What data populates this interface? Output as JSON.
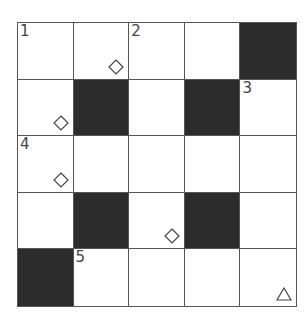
{
  "puzzle": {
    "rows": 5,
    "cols": 5,
    "colors": {
      "block": "#2c2c2c",
      "line": "#555555",
      "cell": "#ffffff"
    },
    "cells": [
      [
        {
          "type": "white",
          "number": "1"
        },
        {
          "type": "white",
          "mark": "diamond"
        },
        {
          "type": "white",
          "number": "2"
        },
        {
          "type": "white"
        },
        {
          "type": "black"
        }
      ],
      [
        {
          "type": "white",
          "mark": "diamond"
        },
        {
          "type": "black"
        },
        {
          "type": "white"
        },
        {
          "type": "black"
        },
        {
          "type": "white",
          "number": "3"
        }
      ],
      [
        {
          "type": "white",
          "number": "4",
          "mark": "diamond"
        },
        {
          "type": "white"
        },
        {
          "type": "white"
        },
        {
          "type": "white"
        },
        {
          "type": "white"
        }
      ],
      [
        {
          "type": "white"
        },
        {
          "type": "black"
        },
        {
          "type": "white",
          "mark": "diamond"
        },
        {
          "type": "black"
        },
        {
          "type": "white"
        }
      ],
      [
        {
          "type": "black"
        },
        {
          "type": "white",
          "number": "5"
        },
        {
          "type": "white"
        },
        {
          "type": "white"
        },
        {
          "type": "white",
          "mark": "triangle"
        }
      ]
    ]
  }
}
